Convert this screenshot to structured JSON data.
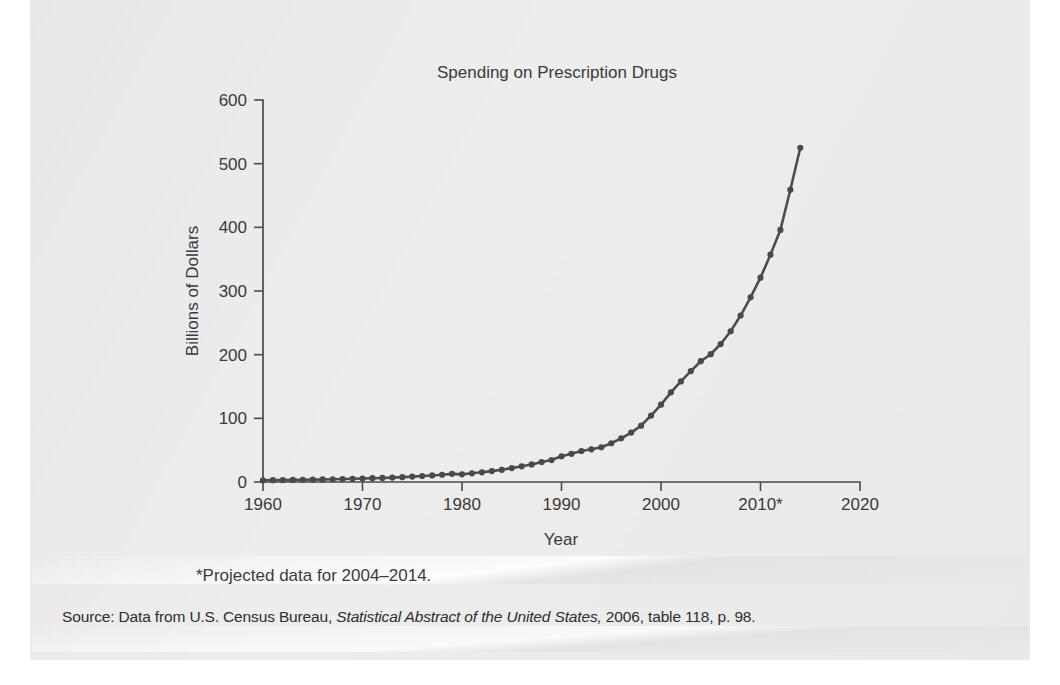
{
  "figure": {
    "footnote": "*Projected data for 2004–2014.",
    "source_prefix": "Source: Data from U.S. Census Bureau, ",
    "source_italic": "Statistical Abstract of the United States,",
    "source_suffix": " 2006, table 118, p. 98."
  },
  "colors": {
    "paper": "#eff0ef",
    "ink": "#3a3a3a",
    "line": "#4d4d4d",
    "axis": "#4a4a4a"
  },
  "chart_data": {
    "type": "line",
    "title": "Spending on Prescription Drugs",
    "xlabel": "Year",
    "ylabel": "Billions of Dollars",
    "xlim": [
      1960,
      2020
    ],
    "ylim": [
      0,
      600
    ],
    "xticks": [
      1960,
      1970,
      1980,
      1990,
      2000,
      2010,
      2020
    ],
    "xtick_labels": [
      "1960",
      "1970",
      "1980",
      "1990",
      "2000",
      "2010*",
      "2020"
    ],
    "yticks": [
      0,
      100,
      200,
      300,
      400,
      500,
      600
    ],
    "ytick_labels": [
      "0",
      "100",
      "200",
      "300",
      "400",
      "500",
      "600"
    ],
    "grid": false,
    "legend": null,
    "markers": "circle",
    "series": [
      {
        "name": "Spending on prescription drugs",
        "x": [
          1960,
          1961,
          1962,
          1963,
          1964,
          1965,
          1966,
          1967,
          1968,
          1969,
          1970,
          1971,
          1972,
          1973,
          1974,
          1975,
          1976,
          1977,
          1978,
          1979,
          1980,
          1981,
          1982,
          1983,
          1984,
          1985,
          1986,
          1987,
          1988,
          1989,
          1990,
          1991,
          1992,
          1993,
          1994,
          1995,
          1996,
          1997,
          1998,
          1999,
          2000,
          2001,
          2002,
          2003,
          2004,
          2005,
          2006,
          2007,
          2008,
          2009,
          2010,
          2011,
          2012,
          2013,
          2014
        ],
        "values": [
          2.7,
          2.9,
          3.1,
          3.3,
          3.5,
          3.7,
          4.0,
          4.3,
          4.6,
          5.0,
          5.5,
          6.0,
          6.4,
          6.9,
          7.6,
          8.5,
          9.4,
          10.3,
          11.4,
          12.8,
          12.0,
          13.7,
          15.2,
          17.1,
          19.2,
          21.8,
          24.6,
          27.6,
          31.4,
          34.5,
          40.3,
          44.3,
          48.7,
          51.3,
          54.6,
          60.9,
          68.6,
          77.6,
          88.5,
          104.4,
          121.5,
          140.8,
          157.9,
          174.2,
          189.7,
          200.7,
          216.7,
          236.8,
          261.5,
          290.0,
          321.0,
          357.0,
          396.0,
          459.0,
          525.0
        ]
      }
    ],
    "annotations": [
      "*Projected data for 2004–2014."
    ]
  }
}
